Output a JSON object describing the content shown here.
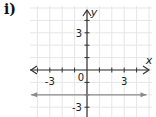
{
  "problem_label": "i)",
  "chart_data": {
    "type": "line",
    "title": "",
    "xlabel": "x",
    "ylabel": "y",
    "xlim": [
      -4.5,
      5
    ],
    "ylim": [
      -3.7,
      4.9
    ],
    "grid": true,
    "x_tick_labels": [
      {
        "value": -3,
        "text": "-3"
      },
      {
        "value": 3,
        "text": "3"
      }
    ],
    "y_tick_labels": [
      {
        "value": 3,
        "text": "3"
      },
      {
        "value": -3,
        "text": "-3"
      }
    ],
    "origin_label": "0",
    "series": [
      {
        "name": "y = -2",
        "equation": "y = -2",
        "x": [
          -4.5,
          4.8
        ],
        "y": [
          -2,
          -2
        ],
        "color": "#8a8a8a",
        "arrows": "both"
      }
    ],
    "colors": {
      "grid": "#e6e6e6",
      "axis": "#333333",
      "line": "#8a8a8a"
    }
  }
}
